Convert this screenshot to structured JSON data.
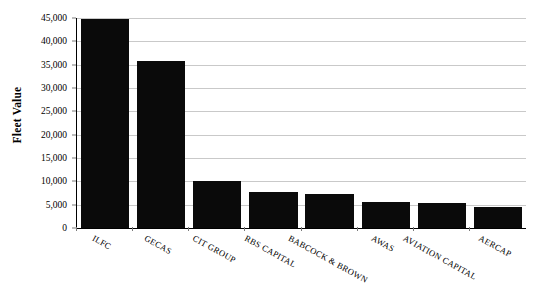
{
  "chart_data": {
    "type": "bar",
    "title": "",
    "subtitle": "",
    "xlabel": "",
    "ylabel": "Fleet Value",
    "ylim": [
      0,
      45000
    ],
    "ytick_labels": [
      "45,000",
      "40,000",
      "35,000",
      "30,000",
      "25,000",
      "20,000",
      "15,000",
      "10,000",
      "5,000",
      "0"
    ],
    "ytick_values": [
      45000,
      40000,
      35000,
      30000,
      25000,
      20000,
      15000,
      10000,
      5000,
      0
    ],
    "grid": "horizontal",
    "legend": "none",
    "bar_color": "#0a0a0a",
    "gridline_color": "#c9c9c9",
    "axis_color": "#000000",
    "categories": [
      "ILFC",
      "GECAS",
      "CIT GROUP",
      "RBS CAPITAL",
      "BABCOCK & BROWN",
      "AWAS",
      "AVIATION CAPITAL",
      "AERCAP"
    ],
    "values": [
      44700,
      35800,
      10000,
      7700,
      7300,
      5500,
      5400,
      4600
    ],
    "annotations": []
  }
}
